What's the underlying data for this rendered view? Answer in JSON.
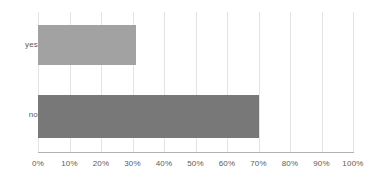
{
  "chart_data": {
    "type": "bar",
    "orientation": "horizontal",
    "title": "",
    "subtitle": "",
    "xlabel": "",
    "ylabel": "",
    "categories": [
      "yes",
      "no"
    ],
    "values": [
      31,
      70
    ],
    "value_unit": "%",
    "xlim": [
      0,
      100
    ],
    "x_ticks": [
      0,
      10,
      20,
      30,
      40,
      50,
      60,
      70,
      80,
      90,
      100
    ],
    "x_tick_labels": [
      "0%",
      "10%",
      "20%",
      "30%",
      "40%",
      "50%",
      "60%",
      "70%",
      "80%",
      "90%",
      "100%"
    ],
    "grid": {
      "vertical": true,
      "horizontal": false,
      "color": "#e3e3e3"
    },
    "legend": {
      "visible": false,
      "position": "none",
      "entries": []
    },
    "bar_colors": [
      "#a2a2a2",
      "#787878"
    ],
    "annotations": [],
    "series": [
      {
        "name": "",
        "points": [
          {
            "category": "yes",
            "value": 31,
            "label": "",
            "color": "#a2a2a2"
          },
          {
            "category": "no",
            "value": 70,
            "label": "",
            "color": "#787878"
          }
        ]
      }
    ]
  },
  "axes": {
    "y_axis_color": "#b6b6b6",
    "x_axis_color": "#b0b0b0"
  },
  "style": {
    "background": "#ffffff",
    "label_color": "#5a5a5a"
  }
}
